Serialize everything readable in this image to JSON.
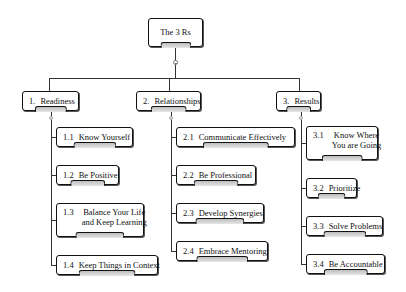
{
  "diagram": {
    "type": "hierarchy-tree",
    "root": {
      "label": "The 3 Rs"
    },
    "branches": [
      {
        "number": "1.",
        "label": "Readiness",
        "children": [
          {
            "number": "1.1",
            "label": "Know Yourself"
          },
          {
            "number": "1.2",
            "label": "Be Positive"
          },
          {
            "number": "1.3",
            "label": "Balance Your Life",
            "label2": "and Keep Learning"
          },
          {
            "number": "1.4",
            "label": "Keep Things in Context"
          }
        ]
      },
      {
        "number": "2.",
        "label": "Relationships",
        "children": [
          {
            "number": "2.1",
            "label": "Communicate Effectively"
          },
          {
            "number": "2.2",
            "label": "Be Professional"
          },
          {
            "number": "2.3",
            "label": "Develop Synergies"
          },
          {
            "number": "2.4",
            "label": "Embrace Mentoring"
          }
        ]
      },
      {
        "number": "3.",
        "label": "Results",
        "children": [
          {
            "number": "3.1",
            "label": "Know Where",
            "label2": "You are Going"
          },
          {
            "number": "3.2",
            "label": "Prioritize"
          },
          {
            "number": "3.3",
            "label": "Solve Problems"
          },
          {
            "number": "3.4",
            "label": "Be Accountable"
          }
        ]
      }
    ]
  }
}
